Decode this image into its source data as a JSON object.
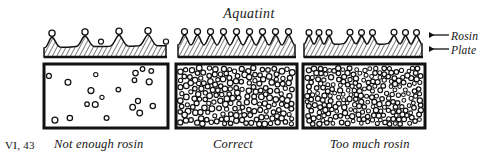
{
  "figure": {
    "title": "Aquatint",
    "plate_number": "VI, 43",
    "background_color": "#ffffff",
    "ink_color": "#111111"
  },
  "side_labels": [
    {
      "label": "Rosin",
      "target": "grain-layer",
      "arrow": "left-arrow-icon"
    },
    {
      "label": "Plate",
      "target": "metal-plate",
      "arrow": "left-arrow-icon"
    }
  ],
  "panels": [
    {
      "caption": "Not enough rosin",
      "density": "sparse",
      "grain_count": 20,
      "cross_section": {
        "peaks": 6,
        "profile": "low-widely-spaced-mounds"
      }
    },
    {
      "caption": "Correct",
      "density": "even",
      "grain_count": 190,
      "cross_section": {
        "peaks": 13,
        "profile": "uniform-closely-spaced-peaks"
      }
    },
    {
      "caption": "Too much rosin",
      "density": "overcrowded",
      "grain_count": 430,
      "cross_section": {
        "peaks": 12,
        "profile": "clustered-grouped-peaks"
      }
    }
  ],
  "chart_data": {
    "type": "scatter",
    "title": "Aquatint",
    "xlabel": "",
    "ylabel": "",
    "categories": [
      "Not enough rosin",
      "Correct",
      "Too much rosin"
    ],
    "values": [
      20,
      190,
      430
    ],
    "series": [
      {
        "name": "rosin grains per plate area",
        "values": [
          20,
          190,
          430
        ]
      }
    ],
    "annotations": [
      "Rosin",
      "Plate",
      "VI, 43"
    ],
    "legend": "none",
    "grid": false
  }
}
